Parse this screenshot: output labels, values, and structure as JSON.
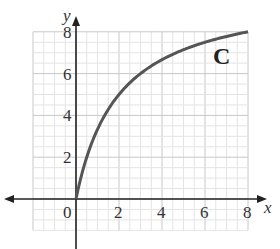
{
  "chart_data": {
    "type": "line",
    "title": "",
    "xlabel": "x",
    "ylabel": "y",
    "xlim": [
      0,
      8
    ],
    "ylim": [
      0,
      8
    ],
    "grid": true,
    "x_ticks": [
      "0",
      "2",
      "4",
      "6",
      "8"
    ],
    "y_ticks": [
      "2",
      "4",
      "6",
      "8"
    ],
    "annotations": [
      "C"
    ],
    "series": [
      {
        "name": "C",
        "x": [
          0,
          0.25,
          0.5,
          1,
          1.5,
          2,
          3,
          4,
          5,
          6,
          7,
          8
        ],
        "y": [
          0,
          1.1,
          2.0,
          3.33,
          4.29,
          5.0,
          6.0,
          6.67,
          7.14,
          7.5,
          7.78,
          8.0
        ]
      }
    ],
    "colors": {
      "curve": "#555555",
      "axis": "#222222",
      "grid_major": "#c8c8c8",
      "grid_minor": "#e4e4e4"
    }
  },
  "labels": {
    "x_axis": "x",
    "y_axis": "y",
    "curve": "C",
    "origin": "0",
    "x2": "2",
    "x4": "4",
    "x6": "6",
    "x8": "8",
    "y2": "2",
    "y4": "4",
    "y6": "6",
    "y8": "8"
  }
}
